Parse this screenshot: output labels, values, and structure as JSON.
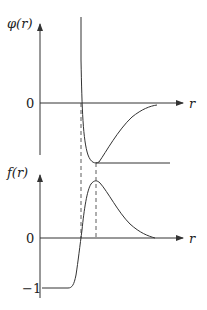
{
  "top_plot": {
    "y_label": "φ(r)",
    "x_label": "r",
    "zero_label": "0"
  },
  "bottom_plot": {
    "y_label": "f(r)",
    "x_label": "r",
    "zero_label": "0",
    "minus_one_label": "−1"
  },
  "colors": {
    "line": "#333333",
    "text": "#222222"
  }
}
